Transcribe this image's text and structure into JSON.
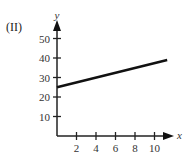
{
  "panel_label": "(II)",
  "chart_data": {
    "type": "line",
    "title": "",
    "xlabel": "x",
    "ylabel": "y",
    "x_ticks": [
      2,
      4,
      6,
      8,
      10
    ],
    "y_ticks": [
      10,
      20,
      30,
      40,
      50
    ],
    "xlim": [
      0,
      11.5
    ],
    "ylim": [
      0,
      55
    ],
    "grid": false,
    "series": [
      {
        "name": "line",
        "x": [
          0,
          11.3
        ],
        "y": [
          25,
          39
        ]
      }
    ]
  }
}
